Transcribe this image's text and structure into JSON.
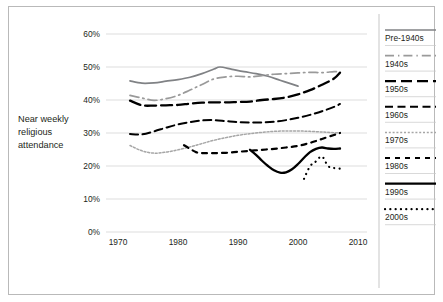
{
  "chart_data": {
    "type": "line",
    "title": "",
    "subtitle": "",
    "xlabel": "",
    "ylabel": "Near weekly religious attendance",
    "ylabel_lines": [
      "Near weekly",
      "religious",
      "attendance"
    ],
    "xlim": [
      1968,
      2011
    ],
    "ylim": [
      0,
      60
    ],
    "xticks": [
      1970,
      1980,
      1990,
      2000,
      2010
    ],
    "xtick_labels": [
      "1970",
      "1980",
      "1990",
      "2000",
      "2010"
    ],
    "yticks": [
      0,
      10,
      20,
      30,
      40,
      50,
      60
    ],
    "ytick_labels": [
      "0%",
      "10%",
      "20%",
      "30%",
      "40%",
      "50%",
      "60%"
    ],
    "grid": "horizontal",
    "legend_position": "right",
    "series": [
      {
        "name": "Pre-1940s",
        "color": "#808285",
        "width": 1.7,
        "dash": "none",
        "x": [
          1972,
          1974,
          1976,
          1978,
          1980,
          1982,
          1984,
          1986,
          1987,
          1989,
          1991,
          1993,
          1995,
          1997,
          1999,
          2000
        ],
        "values": [
          45.8,
          45.1,
          45.2,
          45.7,
          46.2,
          46.9,
          48.0,
          49.4,
          50.0,
          49.3,
          48.6,
          48.0,
          47.2,
          46.0,
          44.8,
          44.2
        ]
      },
      {
        "name": "1940s",
        "color": "#9a9a9a",
        "width": 1.7,
        "dash": "dashdot-long",
        "x": [
          1972,
          1974,
          1976,
          1978,
          1980,
          1982,
          1984,
          1986,
          1988,
          1990,
          1992,
          1994,
          1996,
          1998,
          2000,
          2002,
          2004,
          2006,
          2007
        ],
        "values": [
          41.4,
          40.6,
          39.9,
          40.4,
          41.4,
          43.0,
          44.7,
          46.4,
          47.0,
          47.2,
          47.0,
          47.4,
          47.8,
          48.0,
          48.2,
          48.4,
          48.3,
          48.6,
          48.6
        ]
      },
      {
        "name": "1950s",
        "color": "#000000",
        "width": 2.3,
        "dash": "long-dash",
        "x": [
          1972,
          1974,
          1976,
          1978,
          1980,
          1982,
          1984,
          1986,
          1988,
          1990,
          1992,
          1994,
          1996,
          1998,
          2000,
          2002,
          2004,
          2006,
          2007
        ],
        "values": [
          39.8,
          38.4,
          38.3,
          38.4,
          38.5,
          38.9,
          39.2,
          39.3,
          39.3,
          39.4,
          39.5,
          40.0,
          40.3,
          40.8,
          41.7,
          43.0,
          44.6,
          46.5,
          48.3
        ]
      },
      {
        "name": "1960s",
        "color": "#000000",
        "width": 2.0,
        "dash": "dash",
        "x": [
          1972,
          1974,
          1976,
          1978,
          1980,
          1982,
          1984,
          1986,
          1988,
          1990,
          1992,
          1994,
          1996,
          1998,
          2000,
          2002,
          2004,
          2006,
          2007
        ],
        "values": [
          29.7,
          29.6,
          30.5,
          31.6,
          32.6,
          33.3,
          33.8,
          33.9,
          33.6,
          33.3,
          33.2,
          33.2,
          33.4,
          33.9,
          34.6,
          35.5,
          36.6,
          37.9,
          38.8
        ]
      },
      {
        "name": "1970s",
        "color": "#a6a6a6",
        "width": 1.5,
        "dash": "fine-dot",
        "x": [
          1972,
          1974,
          1976,
          1978,
          1980,
          1982,
          1984,
          1986,
          1988,
          1990,
          1992,
          1994,
          1996,
          1998,
          2000,
          2002,
          2004,
          2006,
          2007
        ],
        "values": [
          26.2,
          24.6,
          23.9,
          24.2,
          24.9,
          25.8,
          26.8,
          27.8,
          28.6,
          29.3,
          29.8,
          30.2,
          30.5,
          30.6,
          30.6,
          30.5,
          30.3,
          30.1,
          30.1
        ]
      },
      {
        "name": "1980s",
        "color": "#000000",
        "width": 2.2,
        "dash": "short-dash",
        "x": [
          1981,
          1982,
          1983,
          1984,
          1986,
          1988,
          1990,
          1992,
          1994,
          1996,
          1998,
          2000,
          2002,
          2004,
          2006,
          2007
        ],
        "values": [
          26.3,
          25.2,
          24.2,
          23.9,
          23.9,
          24.0,
          24.3,
          24.6,
          24.9,
          25.2,
          25.6,
          26.1,
          27.0,
          28.2,
          29.4,
          30.0
        ]
      },
      {
        "name": "1990s",
        "color": "#000000",
        "width": 2.3,
        "dash": "none",
        "x": [
          1992,
          1993,
          1994,
          1995,
          1996,
          1997,
          1998,
          1999,
          2000,
          2001,
          2002,
          2003,
          2004,
          2005,
          2006,
          2007
        ],
        "values": [
          24.9,
          23.4,
          21.6,
          20.0,
          18.7,
          18.0,
          18.1,
          19.0,
          20.6,
          22.5,
          24.2,
          25.2,
          25.6,
          25.3,
          25.2,
          25.3
        ]
      },
      {
        "name": "2000s",
        "color": "#000000",
        "width": 2.2,
        "dash": "dot",
        "x": [
          2001,
          2002,
          2003,
          2004,
          2005,
          2006,
          2007
        ],
        "values": [
          16.1,
          19.9,
          21.4,
          22.9,
          20.0,
          19.4,
          19.2
        ]
      }
    ]
  },
  "legend": {
    "entries": [
      {
        "label": "Pre-1940s"
      },
      {
        "label": "1940s"
      },
      {
        "label": "1950s"
      },
      {
        "label": "1960s"
      },
      {
        "label": "1970s"
      },
      {
        "label": "1980s"
      },
      {
        "label": "1990s"
      },
      {
        "label": "2000s"
      }
    ]
  },
  "colors": {
    "frame": "#b9b9b9",
    "grid": "#d4d4d4",
    "text": "#231f20",
    "background": "#ffffff"
  }
}
